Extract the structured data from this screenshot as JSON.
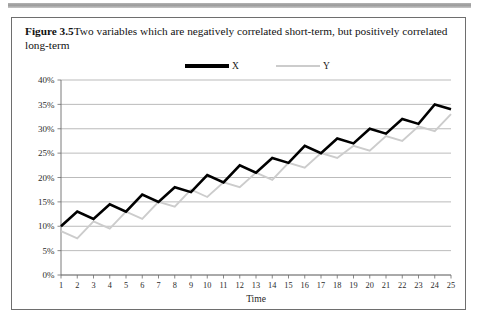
{
  "page": {
    "figure_label": "Figure 3.5",
    "caption": "Two variables which are negatively correlated short-term, but positively correlated long-term"
  },
  "legend": {
    "items": [
      {
        "name": "X",
        "color": "#000000"
      },
      {
        "name": "Y",
        "color": "#cccccc"
      }
    ]
  },
  "chart_data": {
    "type": "line",
    "title": "Two variables which are negatively correlated short-term, but positively correlated long-term",
    "xlabel": "Time",
    "ylabel": "",
    "grid": true,
    "legend_position": "top-center",
    "xlim": [
      1,
      25
    ],
    "ylim": [
      0,
      40
    ],
    "ytick_labels": [
      "0%",
      "5%",
      "10%",
      "15%",
      "20%",
      "25%",
      "30%",
      "35%",
      "40%"
    ],
    "ytick_values": [
      0,
      5,
      10,
      15,
      20,
      25,
      30,
      35,
      40
    ],
    "x": [
      1,
      2,
      3,
      4,
      5,
      6,
      7,
      8,
      9,
      10,
      11,
      12,
      13,
      14,
      15,
      16,
      17,
      18,
      19,
      20,
      21,
      22,
      23,
      24,
      25
    ],
    "xtick_labels": [
      "1",
      "2",
      "3",
      "4",
      "5",
      "6",
      "7",
      "8",
      "9",
      "10",
      "11",
      "12",
      "13",
      "14",
      "15",
      "16",
      "17",
      "18",
      "19",
      "20",
      "21",
      "22",
      "23",
      "24",
      "25"
    ],
    "series": [
      {
        "name": "X",
        "color": "#000000",
        "values": [
          10.0,
          13.0,
          11.5,
          14.5,
          13.0,
          16.5,
          15.0,
          18.0,
          17.0,
          20.5,
          19.0,
          22.5,
          21.0,
          24.0,
          23.0,
          26.5,
          25.0,
          28.0,
          27.0,
          30.0,
          29.0,
          32.0,
          31.0,
          35.0,
          34.0
        ]
      },
      {
        "name": "Y",
        "color": "#cccccc",
        "values": [
          9.0,
          7.5,
          11.0,
          9.5,
          13.0,
          11.5,
          15.0,
          14.0,
          17.5,
          16.0,
          19.0,
          18.0,
          21.0,
          19.5,
          23.0,
          22.0,
          25.0,
          24.0,
          26.5,
          25.5,
          28.5,
          27.5,
          30.5,
          29.5,
          33.0
        ]
      }
    ]
  }
}
